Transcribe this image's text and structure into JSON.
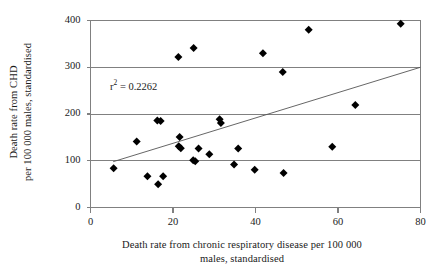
{
  "chart_data": {
    "type": "scatter",
    "title": "",
    "xlabel": "Death rate from chronic respiratory disease per 100 000 males, standardised",
    "xlabel_line1": "Death rate from chronic respiratory disease per 100 000",
    "xlabel_line2": "males, standardised",
    "ylabel": "Death rate from CHD per 100 000 males, standardised",
    "ylabel_line1": "Death rate from CHD",
    "ylabel_line2": "per 100 000 males, standardised",
    "xlim": [
      0,
      80
    ],
    "ylim": [
      0,
      400
    ],
    "xticks": [
      0,
      20,
      40,
      60,
      80
    ],
    "yticks": [
      0,
      100,
      200,
      300,
      400
    ],
    "xtick_labels": [
      "0",
      "20",
      "40",
      "60",
      "80"
    ],
    "ytick_labels": [
      "0",
      "100",
      "200",
      "300",
      "400"
    ],
    "grid": "horizontal",
    "legend": "none",
    "marker": "diamond",
    "marker_color": "#000000",
    "annotation": "r 2 = 0.2262",
    "annotation_prefix": "r",
    "annotation_exponent": "2",
    "annotation_value": "= 0.2262",
    "r_squared": 0.2262,
    "trendline": {
      "type": "linear",
      "color": "#555555",
      "x_start": 5.5,
      "y_start": 98,
      "x_end": 80,
      "y_end": 300
    },
    "points": [
      {
        "x": 5.6,
        "y": 84
      },
      {
        "x": 11.2,
        "y": 141
      },
      {
        "x": 13.8,
        "y": 67
      },
      {
        "x": 16.2,
        "y": 186
      },
      {
        "x": 17.0,
        "y": 185
      },
      {
        "x": 16.4,
        "y": 50
      },
      {
        "x": 17.6,
        "y": 67
      },
      {
        "x": 21.3,
        "y": 322
      },
      {
        "x": 21.6,
        "y": 151
      },
      {
        "x": 21.4,
        "y": 131
      },
      {
        "x": 21.9,
        "y": 127
      },
      {
        "x": 25.0,
        "y": 341
      },
      {
        "x": 24.9,
        "y": 101
      },
      {
        "x": 25.4,
        "y": 99
      },
      {
        "x": 26.2,
        "y": 126
      },
      {
        "x": 28.8,
        "y": 114
      },
      {
        "x": 31.3,
        "y": 189
      },
      {
        "x": 31.6,
        "y": 181
      },
      {
        "x": 34.8,
        "y": 92
      },
      {
        "x": 35.8,
        "y": 126
      },
      {
        "x": 39.8,
        "y": 81
      },
      {
        "x": 41.8,
        "y": 330
      },
      {
        "x": 46.6,
        "y": 290
      },
      {
        "x": 46.8,
        "y": 74
      },
      {
        "x": 52.9,
        "y": 380
      },
      {
        "x": 58.6,
        "y": 130
      },
      {
        "x": 64.2,
        "y": 219
      },
      {
        "x": 75.2,
        "y": 393
      }
    ]
  }
}
